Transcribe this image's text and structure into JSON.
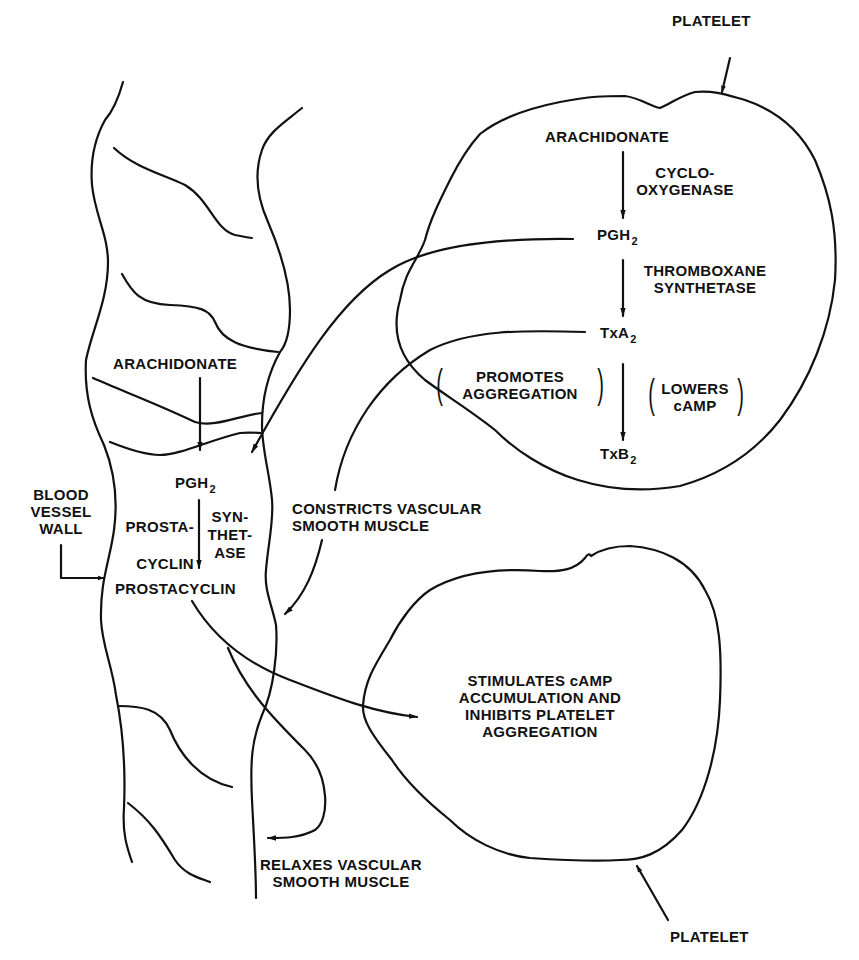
{
  "diagram": {
    "platelet_top": {
      "label": "PLATELET",
      "pathway": {
        "substrate": "ARACHIDONATE",
        "enzyme1_line1": "CYCLO-",
        "enzyme1_line2": "OXYGENASE",
        "intermediate": "PGH",
        "intermediate_sub": "2",
        "enzyme2_line1": "THROMBOXANE",
        "enzyme2_line2": "SYNTHETASE",
        "product": "TxA",
        "product_sub": "2",
        "effect_left_line1": "PROMOTES",
        "effect_left_line2": "AGGREGATION",
        "effect_right_line1": "LOWERS",
        "effect_right_line2": "cAMP",
        "metabolite": "TxB",
        "metabolite_sub": "2"
      }
    },
    "vessel": {
      "label_line1": "BLOOD",
      "label_line2": "VESSEL",
      "label_line3": "WALL",
      "pathway": {
        "substrate": "ARACHIDONATE",
        "intermediate": "PGH",
        "intermediate_sub": "2",
        "enzyme_left_line1": "PROSTA-",
        "enzyme_left_line2": "CYCLIN",
        "enzyme_right_line1": "SYN-",
        "enzyme_right_line2": "THET-",
        "enzyme_right_line3": "ASE",
        "product": "PROSTACYCLIN"
      }
    },
    "effects": {
      "constricts_line1": "CONSTRICTS VASCULAR",
      "constricts_line2": "SMOOTH MUSCLE",
      "relaxes_line1": "RELAXES VASCULAR",
      "relaxes_line2": "SMOOTH MUSCLE"
    },
    "platelet_bottom": {
      "label": "PLATELET",
      "effect_line1": "STIMULATES cAMP",
      "effect_line2": "ACCUMULATION AND",
      "effect_line3": "INHIBITS PLATELET",
      "effect_line4": "AGGREGATION"
    },
    "colors": {
      "ink": "#111111",
      "background": "#ffffff"
    }
  }
}
